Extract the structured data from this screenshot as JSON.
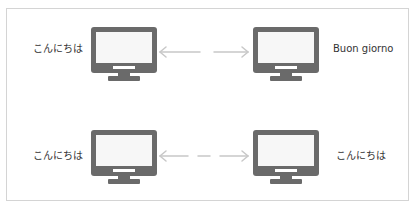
{
  "diagram": {
    "type": "two-row connection diagram",
    "rows": [
      {
        "left": {
          "label": "こんにちは",
          "icon": "monitor-icon"
        },
        "connector": {
          "style": "dashed-bidirectional-arrow",
          "pattern": "long-gap-long"
        },
        "right": {
          "label": "Buon giorno",
          "icon": "monitor-icon"
        }
      },
      {
        "left": {
          "label": "こんにちは",
          "icon": "monitor-icon"
        },
        "connector": {
          "style": "dashed-bidirectional-arrow",
          "pattern": "long-dash-long"
        },
        "right": {
          "label": "こんにちは",
          "icon": "monitor-icon"
        }
      }
    ],
    "colors": {
      "monitor": "#6a6a6a",
      "screen": "#f7f7f7",
      "arrow": "#c8c8c8",
      "frame": "#d4d4d4",
      "text": "#333333"
    }
  }
}
